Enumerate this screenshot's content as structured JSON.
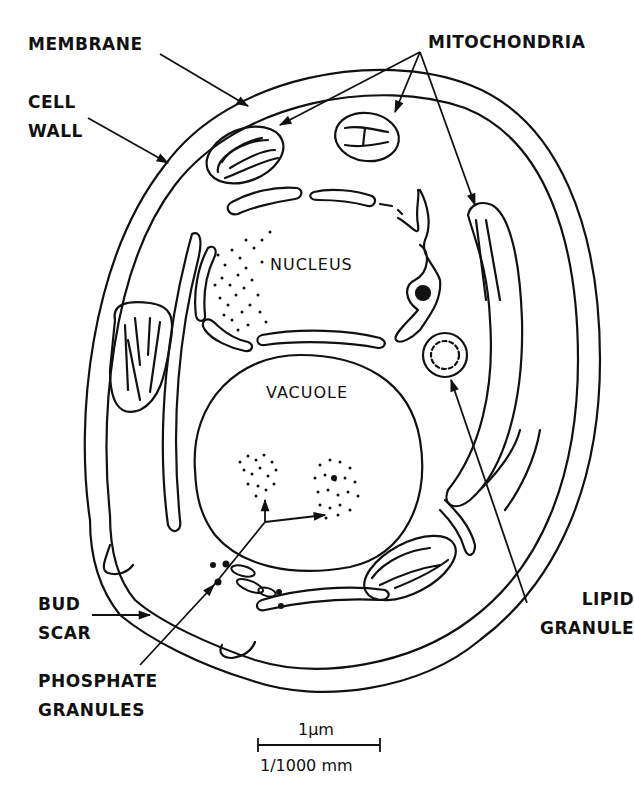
{
  "diagram": {
    "labels": {
      "membrane": "MEMBRANE",
      "cell_wall_line1": "CELL",
      "cell_wall_line2": "WALL",
      "mitochondria": "MITOCHONDRIA",
      "nucleus": "NUCLEUS",
      "vacuole": "VACUOLE",
      "lipid_granule_line1": "LIPID",
      "lipid_granule_line2": "GRANULE",
      "bud_scar_line1": "BUD",
      "bud_scar_line2": "SCAR",
      "phosphate_line1": "PHOSPHATE",
      "phosphate_line2": "GRANULES"
    },
    "scale_bar": {
      "top_label": "1µm",
      "bottom_label": "1/1000 mm"
    },
    "colors": {
      "ink": "#111111",
      "background": "#ffffff"
    }
  }
}
